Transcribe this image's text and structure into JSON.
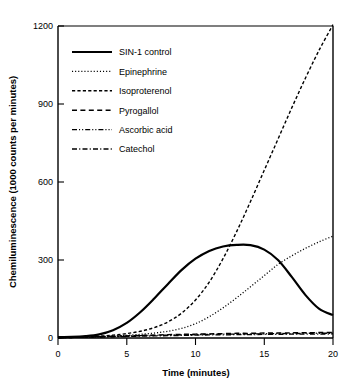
{
  "chart_data": {
    "type": "line",
    "title": "",
    "xlabel": "Time  (minutes)",
    "ylabel": "Chemiluminescence (1000 counts per minutes)",
    "xlim": [
      0,
      20
    ],
    "ylim": [
      0,
      1200
    ],
    "xticks": [
      "0",
      "5",
      "10",
      "15",
      "20"
    ],
    "xtick_values": [
      0,
      5,
      10,
      15,
      20
    ],
    "yticks": [
      "0",
      "300",
      "600",
      "900",
      "1200"
    ],
    "ytick_values": [
      0,
      300,
      600,
      900,
      1200
    ],
    "grid": false,
    "legend_position": "upper-left-inside",
    "x": [
      0,
      1,
      2,
      3,
      4,
      5,
      6,
      7,
      8,
      9,
      10,
      11,
      12,
      13,
      14,
      15,
      16,
      17,
      18,
      19,
      20
    ],
    "series": [
      {
        "name": "SIN-1 control",
        "style": "solid",
        "values": [
          3,
          4,
          7,
          14,
          30,
          58,
          100,
          152,
          208,
          262,
          305,
          335,
          352,
          358,
          357,
          340,
          300,
          235,
          165,
          112,
          88
        ]
      },
      {
        "name": "Epinephrine",
        "style": "dotted",
        "values": [
          1,
          2,
          3,
          5,
          7,
          10,
          14,
          19,
          26,
          37,
          55,
          82,
          116,
          155,
          197,
          240,
          283,
          316,
          345,
          370,
          392
        ]
      },
      {
        "name": "Isoproterenol",
        "style": "dashed-short",
        "values": [
          1,
          2,
          4,
          7,
          11,
          17,
          26,
          40,
          62,
          96,
          146,
          215,
          305,
          410,
          525,
          645,
          765,
          885,
          1000,
          1108,
          1205
        ]
      },
      {
        "name": "Pyrogallol",
        "style": "dashed-medium",
        "values": [
          2,
          3,
          4,
          5,
          7,
          8,
          10,
          11,
          13,
          14,
          15,
          16,
          17,
          18,
          18,
          19,
          19,
          20,
          20,
          21,
          21
        ]
      },
      {
        "name": "Ascorbic acid",
        "style": "dash-dot-dot",
        "values": [
          2,
          3,
          4,
          5,
          6,
          7,
          9,
          10,
          11,
          12,
          13,
          14,
          15,
          15,
          16,
          16,
          17,
          17,
          18,
          18,
          18
        ]
      },
      {
        "name": "Catechol",
        "style": "dash-dot",
        "values": [
          1,
          2,
          3,
          4,
          5,
          6,
          7,
          8,
          9,
          10,
          11,
          12,
          12,
          13,
          13,
          14,
          14,
          15,
          15,
          15,
          16
        ]
      }
    ]
  },
  "legend": {
    "entries": [
      {
        "label": "SIN-1 control",
        "style": "solid"
      },
      {
        "label": "Epinephrine",
        "style": "dotted"
      },
      {
        "label": "Isoproterenol",
        "style": "dashed-short"
      },
      {
        "label": "Pyrogallol",
        "style": "dashed-medium"
      },
      {
        "label": "Ascorbic acid",
        "style": "dash-dot-dot"
      },
      {
        "label": "Catechol",
        "style": "dash-dot"
      }
    ]
  },
  "colors": {
    "ink": "#000000",
    "background": "#ffffff"
  }
}
